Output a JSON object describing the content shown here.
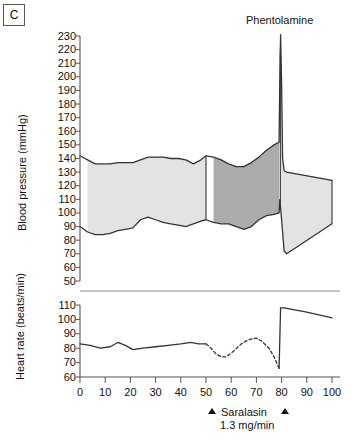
{
  "panel": {
    "label": "C"
  },
  "annotations": {
    "phentolamine": "Phentolamine",
    "saralasin": "Saralasin",
    "saralasin_dose": "1.3 mg/min"
  },
  "colors": {
    "band_light": "#e3e3e3",
    "band_dark": "#acacac",
    "line": "#333333",
    "axis": "#555555",
    "text": "#111111",
    "background": "#ffffff"
  },
  "chart_data": [
    {
      "type": "area",
      "name": "blood-pressure-panel",
      "title": "",
      "xlabel": "",
      "ylabel": "Blood pressure (mmHg)",
      "xlim": [
        0,
        100
      ],
      "ylim": [
        50,
        230
      ],
      "yticks": [
        230,
        220,
        210,
        200,
        190,
        180,
        170,
        160,
        150,
        140,
        130,
        120,
        110,
        100,
        90,
        80,
        70,
        60,
        50
      ],
      "xticks": [
        0,
        10,
        20,
        30,
        40,
        50,
        60,
        70,
        80,
        90,
        100
      ],
      "grid": false,
      "legend": "none",
      "shading": {
        "light_gray_span": [
          0,
          50
        ],
        "dark_gray_span": [
          50,
          79
        ],
        "post_drug_light_span": [
          79.5,
          100
        ]
      },
      "series": [
        {
          "name": "Systolic",
          "x": [
            0,
            3,
            6,
            9,
            12,
            15,
            18,
            21,
            24,
            27,
            30,
            33,
            36,
            39,
            42,
            45,
            48,
            50,
            53,
            56,
            59,
            62,
            65,
            68,
            71,
            74,
            77,
            79,
            79.3,
            79.6,
            80,
            80.4,
            81,
            82,
            100
          ],
          "values": [
            142,
            139,
            136,
            136,
            136,
            137,
            137,
            137,
            139,
            141,
            141,
            141,
            140,
            140,
            139,
            136,
            139,
            142,
            141,
            139,
            136,
            134,
            134,
            137,
            141,
            146,
            150,
            152,
            200,
            231,
            195,
            140,
            131,
            130,
            124
          ]
        },
        {
          "name": "Diastolic",
          "x": [
            0,
            3,
            6,
            9,
            12,
            15,
            18,
            21,
            24,
            27,
            30,
            33,
            36,
            39,
            42,
            45,
            48,
            50,
            53,
            56,
            59,
            62,
            65,
            68,
            71,
            74,
            77,
            79,
            79.3,
            80,
            81,
            82,
            100
          ],
          "values": [
            90,
            86,
            84,
            84,
            85,
            87,
            88,
            89,
            95,
            97,
            95,
            93,
            92,
            91,
            90,
            92,
            94,
            95,
            93,
            92,
            92,
            90,
            88,
            90,
            95,
            98,
            99,
            100,
            110,
            95,
            72,
            70,
            92
          ]
        }
      ]
    },
    {
      "type": "line",
      "name": "heart-rate-panel",
      "title": "",
      "xlabel": "",
      "ylabel": "Heart rate (beats/min)",
      "xlim": [
        0,
        100
      ],
      "ylim": [
        60,
        112
      ],
      "yticks": [
        110,
        100,
        90,
        80,
        70,
        60
      ],
      "xticks": [
        0,
        10,
        20,
        30,
        40,
        50,
        60,
        70,
        80,
        90,
        100
      ],
      "grid": false,
      "legend": "none",
      "series": [
        {
          "name": "Heart rate (solid, baseline)",
          "style": "solid",
          "x": [
            0,
            4,
            8,
            12,
            15,
            18,
            21,
            25,
            30,
            35,
            40,
            44,
            47,
            50
          ],
          "values": [
            83,
            82,
            80,
            81,
            84,
            82,
            79,
            80,
            81,
            82,
            83,
            84,
            83,
            83
          ]
        },
        {
          "name": "Heart rate (dashed, saralasin infusion)",
          "style": "dashed",
          "x": [
            50,
            52,
            54,
            56,
            58,
            61,
            64,
            67,
            70,
            72,
            75,
            77,
            79
          ],
          "values": [
            83,
            80,
            76,
            74,
            74,
            78,
            83,
            86,
            87,
            85,
            80,
            74,
            66
          ]
        },
        {
          "name": "Heart rate (solid, post phentolamine)",
          "style": "solid",
          "x": [
            79,
            79.6,
            81,
            90,
            100
          ],
          "values": [
            66,
            108,
            108,
            105,
            101
          ]
        }
      ]
    }
  ]
}
